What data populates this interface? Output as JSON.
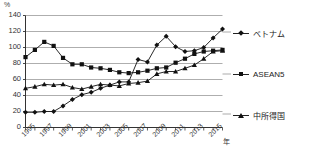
{
  "chart_data": {
    "type": "line",
    "title": "",
    "subtitle": "",
    "xlabel": "年",
    "ylabel": "%",
    "ylim": [
      0,
      140
    ],
    "ytick_step": 20,
    "yticks": [
      "0",
      "20",
      "40",
      "60",
      "80",
      "100",
      "120",
      "140"
    ],
    "grid": true,
    "legend_position": "right",
    "x": [
      1995,
      1996,
      1997,
      1998,
      1999,
      2000,
      2001,
      2002,
      2003,
      2004,
      2005,
      2006,
      2007,
      2008,
      2009,
      2010,
      2011,
      2012,
      2013,
      2014,
      2015,
      2016
    ],
    "xtick_labels": [
      "1995",
      "1997",
      "1999",
      "2001",
      "2003",
      "2005",
      "2007",
      "2009",
      "2011",
      "2013",
      "2015"
    ],
    "xtick_years": [
      1995,
      1997,
      1999,
      2001,
      2003,
      2005,
      2007,
      2009,
      2011,
      2013,
      2015
    ],
    "series": [
      {
        "name": "ベトナム",
        "marker": "diamond",
        "color": "#111111",
        "values": [
          19,
          19,
          20,
          20,
          27,
          35,
          41,
          44,
          49,
          53,
          57,
          57,
          85,
          82,
          103,
          114,
          101,
          95,
          96,
          100,
          112,
          123
        ]
      },
      {
        "name": "ASEAN5",
        "marker": "square",
        "color": "#111111",
        "values": [
          88,
          97,
          107,
          102,
          87,
          79,
          79,
          75,
          74,
          72,
          69,
          68,
          69,
          71,
          74,
          75,
          81,
          86,
          92,
          95,
          96,
          97
        ]
      },
      {
        "name": "中所得国",
        "marker": "triangle",
        "color": "#111111",
        "values": [
          49,
          51,
          54,
          53,
          54,
          50,
          48,
          51,
          54,
          53,
          52,
          55,
          56,
          58,
          67,
          70,
          70,
          74,
          78,
          86,
          95,
          96
        ]
      }
    ]
  },
  "legend": {
    "items": [
      {
        "label": "ベトナム",
        "marker": "diamond"
      },
      {
        "label": "ASEAN5",
        "marker": "square"
      },
      {
        "label": "中所得国",
        "marker": "triangle"
      }
    ]
  },
  "axis": {
    "unit_top": "%",
    "unit_x": "年"
  }
}
